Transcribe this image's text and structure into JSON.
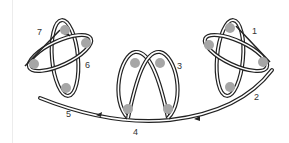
{
  "diagram": {
    "type": "knot-loop-pattern",
    "colors": {
      "line": "#222222",
      "dot": "#a6a6a6",
      "background": "#ffffff"
    },
    "labels": [
      {
        "id": "1",
        "text": "1",
        "x": 252,
        "y": 34
      },
      {
        "id": "2",
        "text": "2",
        "x": 254,
        "y": 100
      },
      {
        "id": "3",
        "text": "3",
        "x": 177,
        "y": 69
      },
      {
        "id": "4",
        "text": "4",
        "x": 133,
        "y": 135
      },
      {
        "id": "5",
        "text": "5",
        "x": 66,
        "y": 117
      },
      {
        "id": "6",
        "text": "6",
        "x": 85,
        "y": 68
      },
      {
        "id": "7",
        "text": "7",
        "x": 37,
        "y": 35
      }
    ],
    "groups": [
      {
        "name": "left-cluster",
        "dots": [
          [
            65,
            30
          ],
          [
            86,
            43
          ],
          [
            34,
            64
          ],
          [
            66,
            88
          ]
        ]
      },
      {
        "name": "center-cluster",
        "dots": [
          [
            135,
            63
          ],
          [
            160,
            63
          ],
          [
            128,
            109
          ],
          [
            168,
            109
          ]
        ]
      },
      {
        "name": "right-cluster",
        "dots": [
          [
            230,
            28
          ],
          [
            209,
            45
          ],
          [
            263,
            62
          ],
          [
            230,
            87
          ]
        ]
      }
    ]
  }
}
